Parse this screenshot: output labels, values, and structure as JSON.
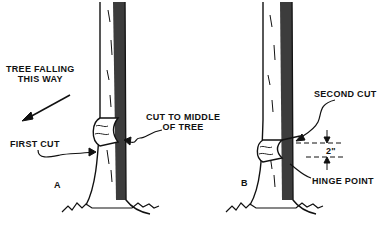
{
  "figure": {
    "panels": [
      {
        "id": "A",
        "panel_label": "A",
        "labels": {
          "direction": [
            "TREE FALLING",
            "THIS WAY"
          ],
          "first_cut": "FIRST CUT",
          "middle_cut": [
            "CUT TO MIDDLE",
            "OF TREE"
          ]
        }
      },
      {
        "id": "B",
        "panel_label": "B",
        "labels": {
          "second_cut": "SECOND CUT",
          "dimension": "2\"",
          "hinge": "HINGE POINT"
        }
      }
    ],
    "colors": {
      "ink": "#111111",
      "background": "#ffffff"
    }
  }
}
